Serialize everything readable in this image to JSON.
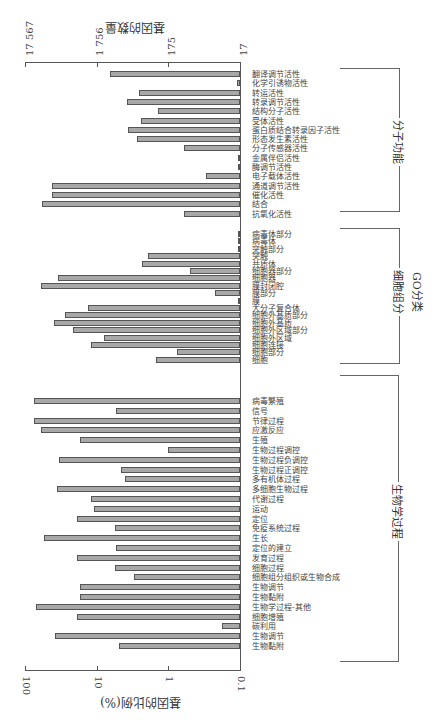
{
  "chart_data": {
    "type": "bar",
    "orientation": "horizontal-rotated",
    "xlabel": "GO分类",
    "ylabel": "基因的比例(%)",
    "ylabel_secondary": "基因的数量",
    "yscale": "log",
    "ylim": [
      0.1,
      100
    ],
    "ticks_percent": [
      "100",
      "10",
      "1",
      "0.1"
    ],
    "ticks_count": [
      "17 567",
      "1 756",
      "175",
      "17"
    ],
    "groups": [
      {
        "name": "分子功能",
        "categories": [
          {
            "label": "翻译调节活性",
            "value": 6.5
          },
          {
            "label": "化学引诱物活性",
            "value": 0.11
          },
          {
            "label": "转运活性",
            "value": 2.6
          },
          {
            "label": "转录调节活性",
            "value": 3.8
          },
          {
            "label": "结构分子活性",
            "value": 1.4
          },
          {
            "label": "受体活性",
            "value": 2.4
          },
          {
            "label": "蛋白质结合转录因子活性",
            "value": 3.7
          },
          {
            "label": "形态发生素活性",
            "value": 2.7
          },
          {
            "label": "分子传感器活性",
            "value": 0.6
          },
          {
            "label": "金属伴侣活性",
            "value": 0.1
          },
          {
            "label": "酶调节活性",
            "value": 0.1
          },
          {
            "label": "电子载体活性",
            "value": 0.3
          },
          {
            "label": "通道调节活性",
            "value": 42
          },
          {
            "label": "催化活性",
            "value": 42
          },
          {
            "label": "结合",
            "value": 57
          },
          {
            "label": "抗氧化活性",
            "value": 0.6
          }
        ]
      },
      {
        "name": "细胞组分",
        "categories": [
          {
            "label": "病毒体部分",
            "value": 0.1
          },
          {
            "label": "病毒体",
            "value": 0.1
          },
          {
            "label": "突触部分",
            "value": 0.1
          },
          {
            "label": "突触",
            "value": 1.9
          },
          {
            "label": "共质体",
            "value": 2.3
          },
          {
            "label": "细胞器部分",
            "value": 0.5
          },
          {
            "label": "细胞器",
            "value": 35
          },
          {
            "label": "膜封闭腔",
            "value": 60
          },
          {
            "label": "膜部分",
            "value": 0.22
          },
          {
            "label": "膜",
            "value": 0.1
          },
          {
            "label": "大分子复合体",
            "value": 13
          },
          {
            "label": "细胞外基质部分",
            "value": 28
          },
          {
            "label": "细胞外基质",
            "value": 39
          },
          {
            "label": "细胞外区域部分",
            "value": 21
          },
          {
            "label": "细胞外区域",
            "value": 8
          },
          {
            "label": "细胞连接",
            "value": 12
          },
          {
            "label": "细胞部分",
            "value": 0.75
          },
          {
            "label": "细胞",
            "value": 1.5
          }
        ]
      },
      {
        "name": "生物学过程",
        "categories": [
          {
            "label": "病毒繁殖",
            "value": 75
          },
          {
            "label": "信号",
            "value": 5.3
          },
          {
            "label": "节律过程",
            "value": 75
          },
          {
            "label": "应激反应",
            "value": 60
          },
          {
            "label": "生殖",
            "value": 17
          },
          {
            "label": "生物过程调控",
            "value": 1
          },
          {
            "label": "生物过程负调控",
            "value": 33
          },
          {
            "label": "生物过程正调控",
            "value": 4.6
          },
          {
            "label": "多有机体过程",
            "value": 4
          },
          {
            "label": "多细胞生物过程",
            "value": 36
          },
          {
            "label": "代谢过程",
            "value": 12
          },
          {
            "label": "运动",
            "value": 11
          },
          {
            "label": "定位",
            "value": 19
          },
          {
            "label": "免疫系统过程",
            "value": 5.6
          },
          {
            "label": "生长",
            "value": 55
          },
          {
            "label": "定位的建立",
            "value": 5.3
          },
          {
            "label": "发育过程",
            "value": 19
          },
          {
            "label": "细胞过程",
            "value": 5.5
          },
          {
            "label": "细胞组分组织或生物合成",
            "value": 3
          },
          {
            "label": "生物调节",
            "value": 17
          },
          {
            "label": "生物黏附",
            "value": 17
          },
          {
            "label": "生物学过程-其他",
            "value": 70
          },
          {
            "label": "细胞增殖",
            "value": 19
          },
          {
            "label": "碳利用",
            "value": 0.18
          },
          {
            "label": "生物调节",
            "value": 38
          },
          {
            "label": "生物黏附",
            "value": 4.8
          }
        ]
      }
    ]
  },
  "labels": {
    "axis_percent_title": "基因的比例(%)",
    "axis_count_title": "基因的数量",
    "go_title": "GO分类",
    "group_mf": "分子功能",
    "group_cc": "细胞组分",
    "group_bp": "生物学过程",
    "tick_p100": "100",
    "tick_p10": "10",
    "tick_p1": "1",
    "tick_p01": "0.1",
    "tick_c1": "17 567",
    "tick_c2": "1 756",
    "tick_c3": "175",
    "tick_c4": "17"
  },
  "colors": {
    "bar_fill": "#a8a8a8",
    "bar_border": "#555555"
  }
}
